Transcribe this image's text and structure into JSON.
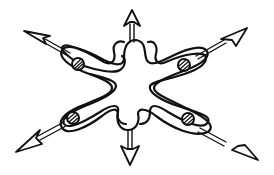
{
  "diagram": {
    "ink_color": "#111111",
    "background": "#ffffff",
    "lobes": [
      {
        "id": "upper-left",
        "has_hatched_circle": true,
        "arrow_direction": "up-left"
      },
      {
        "id": "upper-right",
        "has_hatched_circle": true,
        "arrow_direction": "up-right"
      },
      {
        "id": "lower-left",
        "has_hatched_circle": true,
        "arrow_direction": "down-left"
      },
      {
        "id": "lower-right",
        "has_hatched_circle": true,
        "arrow_direction": "down-right"
      }
    ],
    "small_lobes": [
      {
        "id": "top",
        "arrow_direction": "up"
      },
      {
        "id": "bottom",
        "arrow_direction": "down"
      }
    ],
    "arrow_count": 6,
    "caption": ""
  }
}
